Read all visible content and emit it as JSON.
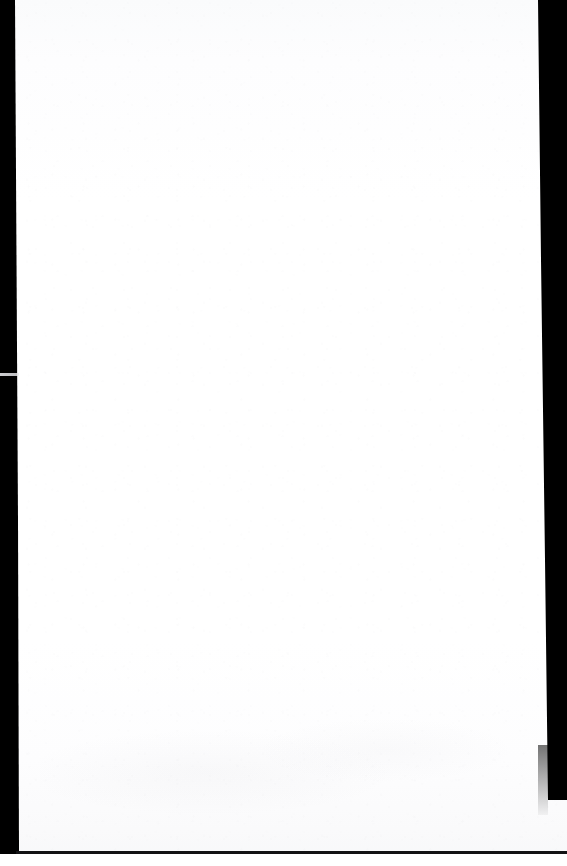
{
  "document": {
    "title": "Scanned Page",
    "page_content": "",
    "page_text": "",
    "is_blank": true,
    "description": "Blank scanned page"
  },
  "canvas": {
    "width": 567,
    "height": 866
  },
  "page": {
    "background_color": "#ffffff",
    "tone_top": "#fafbfc",
    "tone_bottom": "#f7f8f9"
  },
  "scan_artifacts": {
    "edge_color": "#000000",
    "left_bar": {
      "name": "left scanner margin",
      "width": 19,
      "height": 860
    },
    "right_bar": {
      "name": "right scanner margin",
      "left": 536,
      "width": 31,
      "height": 800
    },
    "left_notch": {
      "name": "light streak across left margin",
      "top": 373,
      "height": 3,
      "color": "#d7d7da"
    },
    "bottom_line": {
      "name": "bottom edge line",
      "top": 851,
      "height": 3,
      "color": "#121214"
    }
  }
}
